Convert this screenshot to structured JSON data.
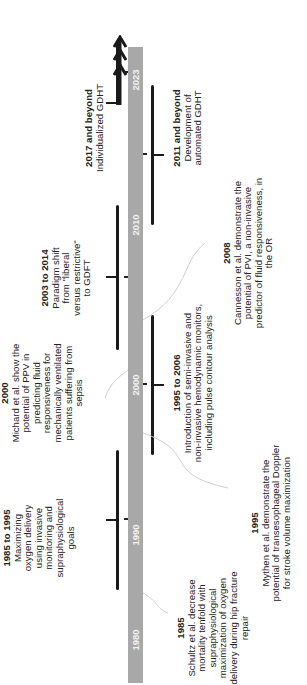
{
  "timeline": {
    "axis": {
      "start_year": 1980,
      "end_year": 2023,
      "year_labels": [
        "1980",
        "1990",
        "2000",
        "2010",
        "2023"
      ],
      "bar_color": "#a8a8a8",
      "arrow": "triple-chevron-arrow pointing toward future"
    },
    "above_axis": [
      {
        "title": "1985 to 1995",
        "lines": [
          "Maximizing",
          "oxygen delivery",
          "using invasive",
          "monitoring and",
          "supraphysiological",
          "goals"
        ]
      },
      {
        "title": "2000",
        "lines": [
          "Michard et al. show the",
          "potential of PPV in",
          "predicting fluid",
          "responsiveness for",
          "mechanically ventilated",
          "patients suffering from",
          "sepsis"
        ]
      },
      {
        "title": "2003 to 2014",
        "lines": [
          "Paradigm shift",
          "from \"liberal",
          "versus restrictive\"",
          "to GDFT"
        ]
      },
      {
        "title": "2017 and beyond",
        "lines": [
          "Individualized GDHT"
        ]
      }
    ],
    "below_axis": [
      {
        "title": "1985",
        "lines": [
          "Schultz et al. decrease",
          "mortality tenfold with",
          "supraphysiological",
          "maximization of oxygen",
          "delivery during hip fracture",
          "repair"
        ]
      },
      {
        "title": "1995",
        "lines": [
          "Mythen et al. demonstrate the",
          "potential of transesophageal Doppler",
          "for stroke volume maximization"
        ]
      },
      {
        "title": "1995 to 2006",
        "lines": [
          "Introduction of semi-invasive and",
          "non-invasive hemodynamic monitors,",
          "including pulse contour analysis"
        ]
      },
      {
        "title": "2008",
        "lines": [
          "Cannesson et al. demonstrate the",
          "potential of PVI, a non-invasive",
          "predictor of fluid responsiveness, in",
          "the OR"
        ]
      },
      {
        "title": "2011 and beyond",
        "lines": [
          "Development of",
          "automated GDHT"
        ]
      }
    ]
  }
}
